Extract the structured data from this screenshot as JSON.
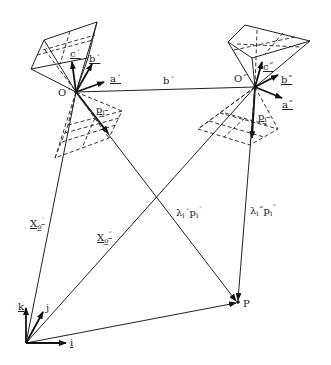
{
  "figure": {
    "labels": {
      "O1": "O´",
      "O2": "O˝",
      "a1": "a´",
      "b1": "b´",
      "c1": "c´",
      "a2": "a˝",
      "b2": "b˝",
      "c2": "c˝",
      "base": "b´",
      "p1": "p",
      "p1_sub": "i",
      "p1_sup": "´",
      "p2": "p",
      "p2_sub": "i",
      "p2_sup": "˝",
      "X01": "X",
      "X01_sub": "o",
      "X01_sup": "´",
      "X02": "X",
      "X02_sub": "o",
      "X02_sup": "˝",
      "ray1": "λ",
      "ray1_sub": "i",
      "ray1_mid": "´p",
      "ray1_sub2": "i",
      "ray1_end": "´",
      "ray2": "λ",
      "ray2_sub": "i",
      "ray2_mid": "˝p",
      "ray2_sub2": "i",
      "ray2_end": "˝",
      "P": "P",
      "i": "i",
      "j": "j",
      "k": "k"
    }
  }
}
